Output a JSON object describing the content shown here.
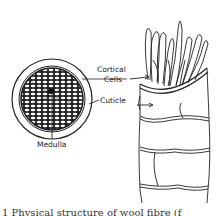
{
  "figure": {
    "title": "Physical structure of wool fibre",
    "cross_section": {
      "labels": {
        "medulla": "Medulla"
      }
    },
    "longitudinal_view": {
      "labels": {
        "cortical_cells_line1": "Cortical",
        "cortical_cells_line2": "Cells",
        "cuticle": "Cuticle"
      }
    },
    "caption": "1 Physical structure of wool fibre (f"
  },
  "colors": {
    "ink": "#222222",
    "background": "#ffffff"
  }
}
